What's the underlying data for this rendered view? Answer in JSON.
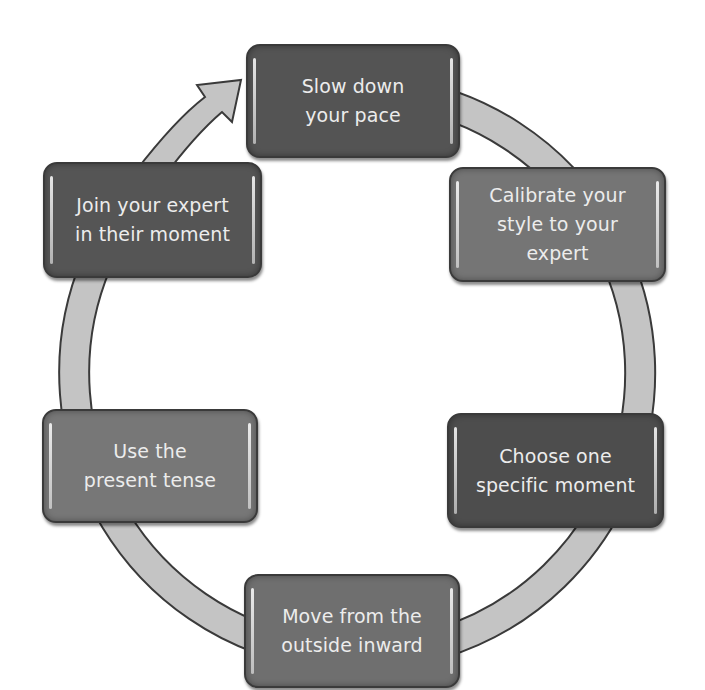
{
  "diagram": {
    "type": "cycle",
    "direction": "clockwise",
    "connector_color": "#c4c4c4",
    "connector_outline": "#3a3a3a",
    "steps": [
      {
        "id": "slow-down",
        "label": "Slow down\nyour pace",
        "color": "#545454",
        "position": "top"
      },
      {
        "id": "calibrate",
        "label": "Calibrate your\nstyle to your\nexpert",
        "color": "#757575",
        "position": "upper-right"
      },
      {
        "id": "choose-moment",
        "label": "Choose one\nspecific moment",
        "color": "#4d4d4d",
        "position": "lower-right"
      },
      {
        "id": "outside-inward",
        "label": "Move from the\noutside inward",
        "color": "#6f6f6f",
        "position": "bottom"
      },
      {
        "id": "present-tense",
        "label": "Use the\npresent tense",
        "color": "#777777",
        "position": "lower-left"
      },
      {
        "id": "join-expert",
        "label": "Join your expert\nin their moment",
        "color": "#555555",
        "position": "upper-left"
      }
    ]
  }
}
